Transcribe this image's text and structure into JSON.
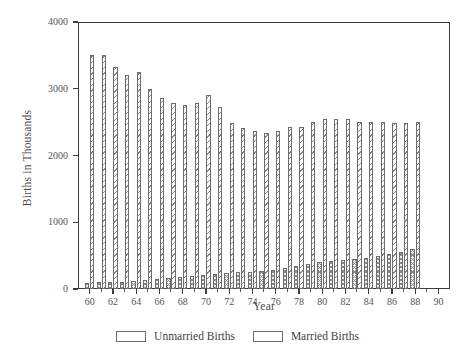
{
  "chart_data": {
    "type": "bar",
    "title": "",
    "xlabel": "Year",
    "ylabel": "Births in Thousands",
    "grid": false,
    "legend_position": "bottom",
    "xlim": [
      59,
      91
    ],
    "ylim": [
      0,
      4000
    ],
    "ytick_labels": [
      "0",
      "1000",
      "2000",
      "3000",
      "4000"
    ],
    "ytick_values": [
      0,
      1000,
      2000,
      3000,
      4000
    ],
    "xtick_labels": [
      "60",
      "62",
      "64",
      "66",
      "68",
      "70",
      "72",
      "74",
      "76",
      "78",
      "80",
      "82",
      "84",
      "86",
      "88",
      "90"
    ],
    "xtick_values": [
      60,
      62,
      64,
      66,
      68,
      70,
      72,
      74,
      76,
      78,
      80,
      82,
      84,
      86,
      88,
      90
    ],
    "categories": [
      60,
      61,
      62,
      63,
      64,
      65,
      66,
      67,
      68,
      69,
      70,
      71,
      72,
      73,
      74,
      75,
      76,
      77,
      78,
      79,
      80,
      81,
      82,
      83,
      84,
      85,
      86,
      87,
      88
    ],
    "series": [
      {
        "name": "Unmarried Births",
        "pattern": "cross-hatch",
        "values": [
          90,
          100,
          105,
          110,
          125,
          135,
          150,
          165,
          180,
          200,
          215,
          225,
          240,
          250,
          260,
          270,
          290,
          320,
          350,
          380,
          400,
          415,
          430,
          450,
          470,
          490,
          520,
          560,
          600
        ]
      },
      {
        "name": "Married Births",
        "pattern": "diagonal-hatch",
        "values": [
          3500,
          3500,
          3320,
          3210,
          3250,
          2990,
          2860,
          2790,
          2750,
          2790,
          2910,
          2730,
          2480,
          2410,
          2360,
          2340,
          2370,
          2420,
          2420,
          2500,
          2550,
          2540,
          2540,
          2500,
          2500,
          2500,
          2480,
          2490,
          2500
        ]
      }
    ],
    "legend": [
      {
        "label": "Unmarried Births",
        "pattern": "cross-hatch"
      },
      {
        "label": "Married Births",
        "pattern": "diagonal-hatch"
      }
    ]
  }
}
